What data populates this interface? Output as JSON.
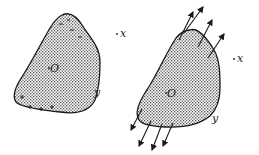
{
  "figure": {
    "left": {
      "body_label": "O",
      "point_x_label": "x",
      "point_y_label": "y",
      "negative_charge": "−",
      "positive_charge": "+"
    },
    "right": {
      "body_label": "O",
      "point_x_label": "x",
      "point_y_label": "y"
    }
  },
  "colors": {
    "outline": "#1a1a1a",
    "dots": "#555555",
    "background": "#ffffff"
  }
}
